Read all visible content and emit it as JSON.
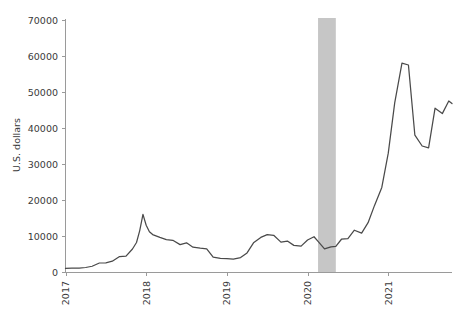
{
  "chart_data": {
    "type": "line",
    "title": "",
    "subtitle": "",
    "xlabel": "",
    "ylabel": "U.S. dollars",
    "ylim": [
      0,
      70000
    ],
    "xlim": [
      2017.0,
      2021.79
    ],
    "grid": false,
    "legend": null,
    "yticks": [
      0,
      10000,
      20000,
      30000,
      40000,
      50000,
      60000,
      70000
    ],
    "ytick_labels": [
      "0",
      "10000",
      "20000",
      "30000",
      "40000",
      "50000",
      "60000",
      "70000"
    ],
    "xticks": [
      2017,
      2018,
      2019,
      2020,
      2021
    ],
    "xtick_labels": [
      "2017",
      "2018",
      "2019",
      "2020",
      "2021"
    ],
    "xtick_label_rotation_deg": 90,
    "line_color": "#4a4a4a",
    "axis_color": "#9a9a9a",
    "text_color": "#3a3a3a",
    "background_color": "#ffffff",
    "annotations": [
      {
        "type": "shaded-band",
        "name": "recession-band",
        "x_start": 2020.13,
        "x_end": 2020.35,
        "color": "#c6c6c6",
        "spans_full_height": true
      }
    ],
    "series": [
      {
        "name": "Bitcoin price",
        "x": [
          2017.0,
          2017.08,
          2017.17,
          2017.25,
          2017.33,
          2017.42,
          2017.5,
          2017.58,
          2017.67,
          2017.75,
          2017.83,
          2017.88,
          2017.92,
          2017.96,
          2018.0,
          2018.04,
          2018.08,
          2018.17,
          2018.25,
          2018.33,
          2018.42,
          2018.5,
          2018.58,
          2018.67,
          2018.75,
          2018.83,
          2018.92,
          2019.0,
          2019.08,
          2019.17,
          2019.25,
          2019.33,
          2019.42,
          2019.5,
          2019.58,
          2019.67,
          2019.75,
          2019.83,
          2019.92,
          2020.0,
          2020.08,
          2020.13,
          2020.21,
          2020.29,
          2020.35,
          2020.42,
          2020.5,
          2020.58,
          2020.67,
          2020.75,
          2020.83,
          2020.92,
          2021.0,
          2021.08,
          2021.17,
          2021.25,
          2021.33,
          2021.42,
          2021.5,
          2021.58,
          2021.67,
          2021.75,
          2021.79
        ],
        "y": [
          980,
          1050,
          1100,
          1250,
          1600,
          2500,
          2550,
          3000,
          4300,
          4400,
          6400,
          8200,
          11500,
          16000,
          13000,
          11200,
          10400,
          9600,
          9000,
          8800,
          7600,
          8100,
          6900,
          6600,
          6400,
          4100,
          3800,
          3700,
          3600,
          4000,
          5300,
          8100,
          9600,
          10400,
          10200,
          8300,
          8600,
          7400,
          7200,
          8900,
          9800,
          8500,
          6400,
          7000,
          7100,
          9100,
          9300,
          11600,
          10800,
          13700,
          18500,
          23500,
          33000,
          47000,
          58000,
          57500,
          38000,
          35000,
          34500,
          45500,
          44000,
          47500,
          46800
        ]
      }
    ],
    "data_description": "Bitcoin price in U.S. dollars, January 2017 through late 2021, with a shaded band marking the early-2020 recession period."
  },
  "axis": {
    "ylabel_text": "U.S. dollars"
  }
}
